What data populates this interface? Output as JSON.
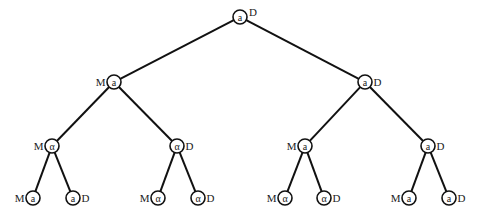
{
  "diagram": {
    "type": "binary-tree",
    "colors": {
      "line": "#111111",
      "text": "#222222",
      "background": "#ffffff"
    },
    "node_radius": 7,
    "nodes": [
      {
        "id": "n0",
        "x": 240,
        "y": 17,
        "symbol": "a",
        "side_label": "D",
        "side": "right-top",
        "parent": null
      },
      {
        "id": "n1",
        "x": 114,
        "y": 82,
        "symbol": "a",
        "side_label": "M",
        "side": "left",
        "parent": "n0"
      },
      {
        "id": "n2",
        "x": 365,
        "y": 82,
        "symbol": "a",
        "side_label": "D",
        "side": "right",
        "parent": "n0"
      },
      {
        "id": "n3",
        "x": 52,
        "y": 146,
        "symbol": "α",
        "side_label": "M",
        "side": "left",
        "parent": "n1"
      },
      {
        "id": "n4",
        "x": 177,
        "y": 146,
        "symbol": "α",
        "side_label": "D",
        "side": "right",
        "parent": "n1"
      },
      {
        "id": "n5",
        "x": 305,
        "y": 146,
        "symbol": "a",
        "side_label": "M",
        "side": "left",
        "parent": "n2"
      },
      {
        "id": "n6",
        "x": 428,
        "y": 146,
        "symbol": "a",
        "side_label": "D",
        "side": "right",
        "parent": "n2"
      },
      {
        "id": "n7",
        "x": 33,
        "y": 198,
        "symbol": "a",
        "side_label": "M",
        "side": "left",
        "parent": "n3"
      },
      {
        "id": "n8",
        "x": 73,
        "y": 198,
        "symbol": "a",
        "side_label": "D",
        "side": "right",
        "parent": "n3"
      },
      {
        "id": "n9",
        "x": 158,
        "y": 198,
        "symbol": "α",
        "side_label": "M",
        "side": "left",
        "parent": "n4"
      },
      {
        "id": "n10",
        "x": 198,
        "y": 198,
        "symbol": "α",
        "side_label": "D",
        "side": "right",
        "parent": "n4"
      },
      {
        "id": "n11",
        "x": 285,
        "y": 198,
        "symbol": "α",
        "side_label": "M",
        "side": "left",
        "parent": "n5"
      },
      {
        "id": "n12",
        "x": 324,
        "y": 198,
        "symbol": "α",
        "side_label": "D",
        "side": "right",
        "parent": "n5"
      },
      {
        "id": "n13",
        "x": 409,
        "y": 198,
        "symbol": "a",
        "side_label": "M",
        "side": "left",
        "parent": "n6"
      },
      {
        "id": "n14",
        "x": 449,
        "y": 198,
        "symbol": "a",
        "side_label": "D",
        "side": "right",
        "parent": "n6"
      }
    ]
  }
}
